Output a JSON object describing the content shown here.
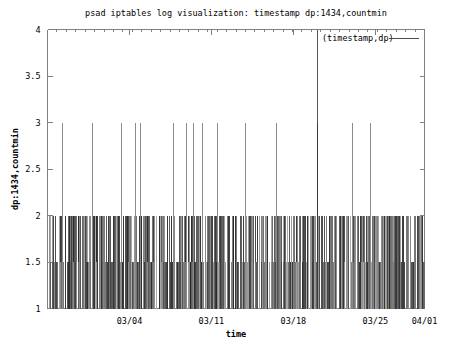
{
  "chart_data": {
    "type": "line",
    "title": "psad iptables log visualization: timestamp dp:1434,countmin",
    "xlabel": "time",
    "ylabel": "dp:1434,countmin",
    "legend": [
      {
        "name": "(timestamp,dp)",
        "color": "#4d4d4d"
      }
    ],
    "legend_position": "top-right",
    "grid": false,
    "ylim": [
      1,
      4
    ],
    "yticks": [
      "1",
      "1.5",
      "2",
      "2.5",
      "3",
      "3.5",
      "4"
    ],
    "ytick_values": [
      1,
      1.5,
      2,
      2.5,
      3,
      3.5,
      4
    ],
    "xticks": [
      "03/04",
      "03/11",
      "03/18",
      "03/25",
      "04/01"
    ],
    "xtick_positions": [
      0.2174,
      0.4348,
      0.6522,
      0.8696,
      1.0
    ],
    "xlim_labels": [
      "02/28",
      "04/01"
    ],
    "series_description": "impulse/vertical-line spikes of minimum packet count per timestamp for destination port 1434",
    "peak_value": 4,
    "peak_x_fraction": 0.7165,
    "spike3_x_fractions": [
      0.0411,
      0.1197,
      0.1968,
      0.2345,
      0.2463,
      0.3355,
      0.3694,
      0.387,
      0.4112,
      0.4507,
      0.5262,
      0.6077,
      0.7165,
      0.8086,
      0.857
    ],
    "baseline_min": 1,
    "common_max": 2,
    "x": [],
    "values": []
  }
}
